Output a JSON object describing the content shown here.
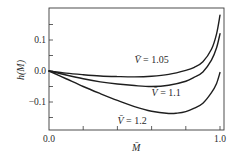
{
  "chart_data": {
    "type": "line",
    "title": "",
    "xlabel": "M̄",
    "ylabel": "h(M)",
    "xlim": [
      0.0,
      1.02
    ],
    "ylim": [
      -0.2,
      0.2
    ],
    "x_ticks": [
      0.0,
      0.2,
      0.4,
      0.6,
      0.8,
      1.0
    ],
    "x_tick_labels": [
      "0.0",
      "",
      "",
      "",
      "",
      "1.0"
    ],
    "y_ticks": [
      -0.15,
      -0.1,
      -0.05,
      0.0,
      0.05,
      0.1,
      0.15
    ],
    "y_tick_labels": [
      "",
      "−0.1",
      "",
      "0.0",
      "",
      "0.1",
      ""
    ],
    "grid": false,
    "legend": "inline labels",
    "series": [
      {
        "name": "V̄ = 1.05",
        "label_var": "V̄",
        "label_value": "= 1.05",
        "x": [
          0.0,
          0.1,
          0.2,
          0.3,
          0.4,
          0.5,
          0.6,
          0.7,
          0.8,
          0.85,
          0.9,
          0.95,
          0.98,
          1.0
        ],
        "y": [
          0.0,
          -0.007,
          -0.012,
          -0.016,
          -0.018,
          -0.019,
          -0.017,
          -0.011,
          0.002,
          0.012,
          0.03,
          0.07,
          0.12,
          0.18
        ],
        "label_pos": [
          0.5,
          0.025
        ]
      },
      {
        "name": "V̄ = 1.1",
        "label_var": "V̄",
        "label_value": "= 1.1",
        "x": [
          0.0,
          0.1,
          0.2,
          0.3,
          0.4,
          0.5,
          0.6,
          0.7,
          0.8,
          0.85,
          0.9,
          0.95,
          0.98,
          1.0
        ],
        "y": [
          0.0,
          -0.013,
          -0.025,
          -0.035,
          -0.042,
          -0.047,
          -0.05,
          -0.046,
          -0.033,
          -0.02,
          -0.003,
          0.035,
          0.075,
          0.12
        ],
        "label_pos": [
          0.6,
          -0.08
        ]
      },
      {
        "name": "V̄ = 1.2",
        "label_var": "V̄",
        "label_value": "= 1.2",
        "x": [
          0.0,
          0.1,
          0.2,
          0.3,
          0.4,
          0.5,
          0.6,
          0.7,
          0.75,
          0.8,
          0.85,
          0.9,
          0.95,
          0.98,
          1.0
        ],
        "y": [
          0.0,
          -0.025,
          -0.05,
          -0.073,
          -0.095,
          -0.115,
          -0.13,
          -0.137,
          -0.136,
          -0.131,
          -0.12,
          -0.104,
          -0.07,
          -0.04,
          -0.005
        ],
        "label_pos": [
          0.4,
          -0.17
        ]
      }
    ]
  }
}
